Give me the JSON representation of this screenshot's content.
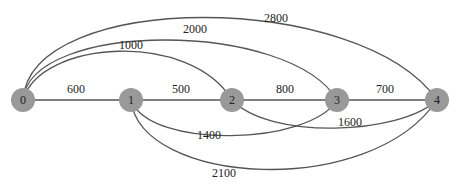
{
  "graph": {
    "type": "weighted-undirected-graph",
    "nodes": [
      {
        "id": "0",
        "label": "0",
        "x": 23,
        "y": 100
      },
      {
        "id": "1",
        "label": "1",
        "x": 131,
        "y": 100
      },
      {
        "id": "2",
        "label": "2",
        "x": 232,
        "y": 100
      },
      {
        "id": "3",
        "label": "3",
        "x": 337,
        "y": 100
      },
      {
        "id": "4",
        "label": "4",
        "x": 437,
        "y": 100
      }
    ],
    "edges": [
      {
        "from": "0",
        "to": "1",
        "weight": "600"
      },
      {
        "from": "1",
        "to": "2",
        "weight": "500"
      },
      {
        "from": "2",
        "to": "3",
        "weight": "800"
      },
      {
        "from": "3",
        "to": "4",
        "weight": "700"
      },
      {
        "from": "0",
        "to": "2",
        "weight": "1000"
      },
      {
        "from": "0",
        "to": "3",
        "weight": "2000"
      },
      {
        "from": "0",
        "to": "4",
        "weight": "2800"
      },
      {
        "from": "1",
        "to": "3",
        "weight": "1400"
      },
      {
        "from": "2",
        "to": "4",
        "weight": "1600"
      },
      {
        "from": "1",
        "to": "4",
        "weight": "2100"
      }
    ],
    "colors": {
      "node_fill": "#999999",
      "edge": "#555555",
      "text": "#222222"
    }
  }
}
